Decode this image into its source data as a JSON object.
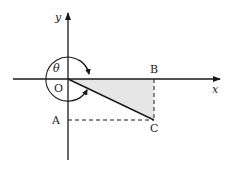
{
  "diagram": {
    "axes": {
      "x_label": "x",
      "y_label": "y",
      "origin_label": "O"
    },
    "points": {
      "A": "A",
      "B": "B",
      "C": "C"
    },
    "angle_label": "θ",
    "colors": {
      "stroke": "#1a1a1a",
      "shade": "#e6e6e6"
    }
  }
}
